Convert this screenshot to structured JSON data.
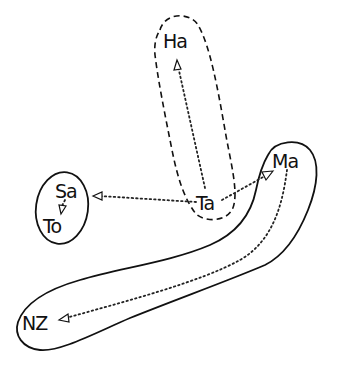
{
  "diagram": {
    "nodes": [
      {
        "id": "Ha",
        "label": "Ha"
      },
      {
        "id": "Ta",
        "label": "Ta"
      },
      {
        "id": "Ma",
        "label": "Ma"
      },
      {
        "id": "Sa",
        "label": "Sa"
      },
      {
        "id": "To",
        "label": "To"
      },
      {
        "id": "NZ",
        "label": "NZ"
      }
    ],
    "edges": [
      {
        "from": "Ta",
        "to": "Ha",
        "style": "dotted-arrow"
      },
      {
        "from": "Ta",
        "to": "Sa",
        "style": "dotted-arrow"
      },
      {
        "from": "Ta",
        "to": "Ma",
        "style": "dotted-arrow"
      },
      {
        "from": "Sa",
        "to": "To",
        "style": "dotted-arrow"
      },
      {
        "from": "Ma",
        "to": "NZ",
        "style": "dotted-arrow"
      }
    ],
    "groups": [
      {
        "members": [
          "Ha",
          "Ta"
        ],
        "outline": "dashed"
      },
      {
        "members": [
          "Sa",
          "To"
        ],
        "outline": "solid"
      },
      {
        "members": [
          "Ma",
          "NZ"
        ],
        "outline": "solid"
      }
    ]
  }
}
